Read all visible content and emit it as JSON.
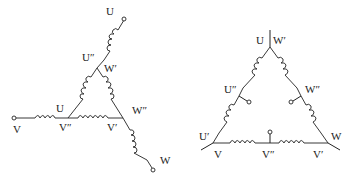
{
  "diagrams": [
    {
      "id": "left",
      "description": "Extended-delta (zigzag) winding connection",
      "labels": {
        "top_terminal": "U",
        "upper_junction_left": "U″",
        "upper_junction_right": "W′",
        "left_vertex": "U",
        "left_vertex_bottom": "V″",
        "right_vertex_top": "W″",
        "right_vertex_bottom": "V′",
        "left_terminal": "V",
        "bottom_right_terminal": "W"
      }
    },
    {
      "id": "right",
      "description": "Delta winding with mid-side taps",
      "labels": {
        "top_left": "U",
        "top_right": "W′",
        "left_tap": "U″",
        "right_tap": "W″",
        "bottom_left_top": "U′",
        "bottom_left": "V",
        "bottom_mid": "V″",
        "bottom_right": "V′",
        "right_vertex": "W"
      }
    }
  ],
  "colors": {
    "line": "#222222",
    "background": "#ffffff"
  }
}
